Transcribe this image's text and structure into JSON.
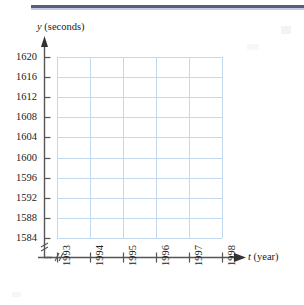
{
  "figure": {
    "kind": "blank-coordinate-grid",
    "top_rule_color": "#4a4f7a",
    "grid_color": "#c3d9ef",
    "axis_color": "#555555",
    "text_color": "#222222"
  },
  "chart_data": {
    "type": "line",
    "title": "",
    "subtitle": "",
    "xlabel": "t (year)",
    "ylabel": "y (seconds)",
    "x_variable": "t",
    "x_unit": "year",
    "y_variable": "y",
    "y_unit": "seconds",
    "x_tick_labels": [
      "1993",
      "1994",
      "1995",
      "1996",
      "1997",
      "1998"
    ],
    "x_values": [
      1993,
      1994,
      1995,
      1996,
      1997,
      1998
    ],
    "xlim": [
      1993,
      1998
    ],
    "y_tick_labels": [
      "1584",
      "1588",
      "1592",
      "1596",
      "1600",
      "1604",
      "1608",
      "1612",
      "1616",
      "1620"
    ],
    "y_values": [
      1584,
      1588,
      1592,
      1596,
      1600,
      1604,
      1608,
      1612,
      1616,
      1620
    ],
    "ylim": [
      1584,
      1620
    ],
    "y_tick_step": 4,
    "x_tick_step": 1,
    "grid": true,
    "legend": null,
    "series": [],
    "annotations": [
      {
        "name": "y-axis-break",
        "symbol": "//",
        "note": "axis break between origin and 1584"
      },
      {
        "name": "x-axis-break",
        "symbol": "//",
        "note": "axis break between origin and 1993"
      }
    ],
    "axis_arrows": {
      "x": true,
      "y": true
    },
    "data_points": "none plotted — empty grid for student plotting"
  },
  "labels": {
    "y_axis_name_var": "y",
    "y_axis_name_unit": "(seconds)",
    "x_axis_name_var": "t",
    "x_axis_name_unit": "(year)"
  }
}
